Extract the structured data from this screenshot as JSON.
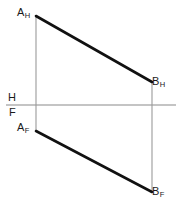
{
  "figure": {
    "background_color": "#ffffff",
    "width": 183,
    "height": 209
  },
  "labels": {
    "a_horizontal": {
      "base": "A",
      "sub": "H"
    },
    "b_horizontal": {
      "base": "B",
      "sub": "H"
    },
    "a_frontal": {
      "base": "A",
      "sub": "F"
    },
    "b_frontal": {
      "base": "B",
      "sub": "F"
    },
    "plane_h": "H",
    "plane_f": "F"
  },
  "colors": {
    "line_color": "#111111",
    "projector_color": "#9a9a9a",
    "ground_line_color": "#8a8a8a",
    "text_color": "#1a1a1a"
  },
  "chart_data": {
    "type": "scatter",
    "xlabel": "",
    "ylabel": "",
    "xlim": [
      0,
      183
    ],
    "ylim": [
      209,
      0
    ],
    "grid": false,
    "legend": null,
    "points": [
      {
        "name": "A_H",
        "label": "A",
        "sublabel": "H",
        "x": 36,
        "y": 16,
        "view": "horizontal"
      },
      {
        "name": "B_H",
        "label": "B",
        "sublabel": "H",
        "x": 152,
        "y": 82,
        "view": "horizontal"
      },
      {
        "name": "A_F",
        "label": "A",
        "sublabel": "F",
        "x": 36,
        "y": 131,
        "view": "frontal"
      },
      {
        "name": "B_F",
        "label": "B",
        "sublabel": "F",
        "x": 152,
        "y": 192,
        "view": "frontal"
      }
    ],
    "series": [
      {
        "name": "line-ab-horizontal-view",
        "kind": "segment",
        "style": "solid-thick",
        "color": "#111111",
        "x": [
          36,
          152
        ],
        "y": [
          16,
          82
        ]
      },
      {
        "name": "line-ab-frontal-view",
        "kind": "segment",
        "style": "solid-thick",
        "color": "#111111",
        "x": [
          36,
          152
        ],
        "y": [
          131,
          192
        ]
      },
      {
        "name": "projector-a",
        "kind": "segment",
        "style": "solid-thin",
        "color": "#9a9a9a",
        "x": [
          36,
          36
        ],
        "y": [
          16,
          131
        ]
      },
      {
        "name": "projector-b",
        "kind": "segment",
        "style": "solid-thin",
        "color": "#9a9a9a",
        "x": [
          152,
          152
        ],
        "y": [
          82,
          192
        ]
      },
      {
        "name": "ground-line-hf",
        "kind": "segment",
        "style": "solid-thin",
        "color": "#8a8a8a",
        "x": [
          6,
          176
        ],
        "y": [
          105,
          105
        ]
      }
    ],
    "annotations": [
      {
        "name": "plane-label-h",
        "text": "H",
        "x": 11,
        "y": 97,
        "note": "horizontal plane, above ground line"
      },
      {
        "name": "plane-label-f",
        "text": "F",
        "x": 12,
        "y": 112,
        "note": "frontal plane, below ground line"
      }
    ]
  }
}
